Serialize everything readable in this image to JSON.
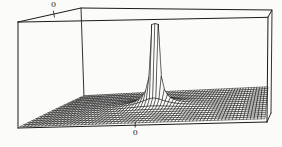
{
  "figure": {
    "width": 282,
    "height": 147,
    "background": "#fbfbf9",
    "box_line_color": "#1b1b1b",
    "mesh_line_color": "#161616",
    "mesh_fill": "#fbfbf9"
  },
  "chart_data": {
    "type": "surface",
    "title": "",
    "function": "z = min(clip_z, k / r^exponent), r = sqrt(x^2 + y^2)",
    "k": 0.005,
    "exponent": 1.5,
    "clip_z": 1,
    "x_range": [
      -0.94,
      1.06
    ],
    "y_range": [
      -1.125,
      0.875
    ],
    "grid": {
      "cols": 68,
      "rows": 16
    },
    "origin_frac_x": 0.47059,
    "origin_frac_y": 0.5625,
    "peak_height_frac": 0.9,
    "x_tick_label": "0",
    "y_tick_label": "0",
    "axes": {
      "x_ticks": [
        0
      ],
      "y_ticks": [
        0
      ],
      "grid_on_surface": true,
      "legend": "none"
    },
    "projection": {
      "floor": {
        "fl": [
          20,
          127
        ],
        "fr": [
          265,
          119
        ],
        "bl": [
          84,
          96
        ],
        "br": [
          268,
          87
        ]
      },
      "ceiling": {
        "fl": [
          20,
          23
        ],
        "fr": [
          265,
          18
        ],
        "bl": [
          84,
          9
        ],
        "br": [
          268,
          11
        ]
      },
      "box": {
        "ftl": [
          18,
          22
        ],
        "btl": [
          81,
          8
        ],
        "btr": [
          272,
          10
        ],
        "ftr": [
          268,
          17
        ],
        "fbl": [
          18,
          128
        ],
        "bbl": [
          84,
          97
        ],
        "bbr": [
          271,
          113
        ],
        "fbr": [
          267,
          122
        ]
      }
    }
  }
}
